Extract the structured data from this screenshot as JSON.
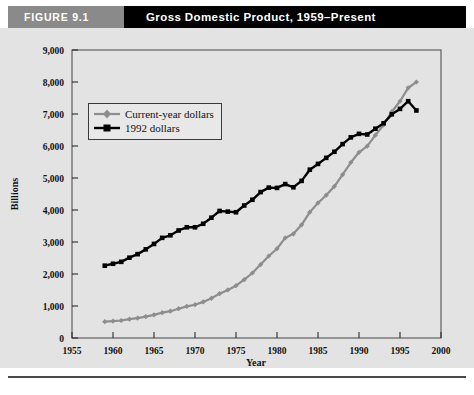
{
  "header": {
    "figure_tag": "FIGURE 9.1",
    "title": "Gross Domestic Product, 1959–Present"
  },
  "chart_data": {
    "type": "line",
    "title": "Gross Domestic Product, 1959–Present",
    "xlabel": "Year",
    "ylabel": "Billions",
    "xlim": [
      1955,
      2000
    ],
    "ylim": [
      0,
      9000
    ],
    "xticks": [
      1955,
      1960,
      1965,
      1970,
      1975,
      1980,
      1985,
      1990,
      1995,
      2000
    ],
    "xtick_labels": [
      "1955",
      "1960",
      "1965",
      "1970",
      "1975",
      "1980",
      "1985",
      "1990",
      "1995",
      "2000"
    ],
    "yticks": [
      0,
      1000,
      2000,
      3000,
      4000,
      5000,
      6000,
      7000,
      8000,
      9000
    ],
    "ytick_labels": [
      "0",
      "1,000",
      "2,000",
      "3,000",
      "4,000",
      "5,000",
      "6,000",
      "7,000",
      "8,000",
      "9,000"
    ],
    "grid": false,
    "legend_position": "upper left",
    "x": [
      1959,
      1960,
      1961,
      1962,
      1963,
      1964,
      1965,
      1966,
      1967,
      1968,
      1969,
      1970,
      1971,
      1972,
      1973,
      1974,
      1975,
      1976,
      1977,
      1978,
      1979,
      1980,
      1981,
      1982,
      1983,
      1984,
      1985,
      1986,
      1987,
      1988,
      1989,
      1990,
      1991,
      1992,
      1993,
      1994,
      1995,
      1996,
      1997
    ],
    "series": [
      {
        "name": "Current-year dollars",
        "color": "#8d8d8d",
        "marker": "diamond",
        "values": [
          509,
          529,
          547,
          589,
          623,
          669,
          724,
          792,
          838,
          916,
          990,
          1040,
          1128,
          1240,
          1386,
          1501,
          1635,
          1824,
          2031,
          2296,
          2563,
          2790,
          3128,
          3255,
          3537,
          3933,
          4220,
          4463,
          4740,
          5104,
          5484,
          5803,
          5996,
          6338,
          6657,
          7072,
          7398,
          7817,
          8000
        ]
      },
      {
        "name": "1992 dollars",
        "color": "#000000",
        "marker": "square",
        "values": [
          2260,
          2320,
          2380,
          2510,
          2620,
          2770,
          2940,
          3130,
          3210,
          3360,
          3460,
          3460,
          3570,
          3760,
          3970,
          3950,
          3930,
          4140,
          4320,
          4560,
          4700,
          4690,
          4810,
          4710,
          4910,
          5260,
          5440,
          5630,
          5820,
          6060,
          6270,
          6380,
          6360,
          6540,
          6710,
          6990,
          7160,
          7400,
          7110
        ]
      }
    ]
  }
}
